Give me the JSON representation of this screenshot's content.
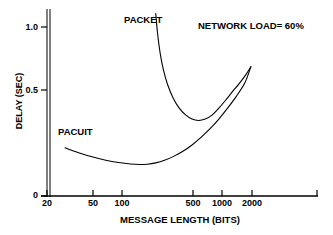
{
  "chart_data": {
    "type": "line",
    "title": "",
    "xlabel": "MESSAGE LENGTH (BITS)",
    "ylabel": "DELAY (SEC)",
    "xscale": "log",
    "xlim": [
      20,
      4000
    ],
    "ylim": [
      0,
      1.08
    ],
    "grid": false,
    "legend_position": "inline-labels",
    "xticks": [
      20,
      50,
      100,
      500,
      1000,
      2000
    ],
    "xtick_labels": [
      "20",
      "50",
      "100",
      "500",
      "1000",
      "2000"
    ],
    "yticks": [
      0,
      0.5,
      1.0
    ],
    "ytick_labels": [
      "0",
      "0.5",
      "1.0"
    ],
    "annotations": [
      {
        "name": "network-load",
        "text": "NETWORK LOAD= 60%"
      }
    ],
    "series": [
      {
        "name": "PACKET",
        "label": "PACKET",
        "color": "#000000",
        "points": [
          [
            230,
            1.08
          ],
          [
            240,
            0.96
          ],
          [
            255,
            0.84
          ],
          [
            275,
            0.74
          ],
          [
            300,
            0.66
          ],
          [
            340,
            0.58
          ],
          [
            390,
            0.52
          ],
          [
            450,
            0.48
          ],
          [
            520,
            0.455
          ],
          [
            600,
            0.447
          ],
          [
            700,
            0.455
          ],
          [
            820,
            0.48
          ],
          [
            950,
            0.52
          ],
          [
            1100,
            0.565
          ],
          [
            1300,
            0.62
          ],
          [
            1500,
            0.665
          ],
          [
            1750,
            0.72
          ],
          [
            1950,
            0.765
          ]
        ]
      },
      {
        "name": "PACUIT",
        "label": "PACUIT",
        "color": "#000000",
        "points": [
          [
            30,
            0.285
          ],
          [
            40,
            0.258
          ],
          [
            55,
            0.232
          ],
          [
            75,
            0.212
          ],
          [
            100,
            0.198
          ],
          [
            130,
            0.189
          ],
          [
            160,
            0.186
          ],
          [
            190,
            0.188
          ],
          [
            230,
            0.196
          ],
          [
            280,
            0.211
          ],
          [
            340,
            0.233
          ],
          [
            420,
            0.263
          ],
          [
            520,
            0.302
          ],
          [
            640,
            0.348
          ],
          [
            780,
            0.398
          ],
          [
            950,
            0.455
          ],
          [
            1150,
            0.518
          ],
          [
            1400,
            0.588
          ],
          [
            1700,
            0.668
          ],
          [
            1950,
            0.765
          ]
        ]
      }
    ]
  },
  "axes": {
    "y_title": "DELAY (SEC)",
    "x_title": "MESSAGE LENGTH (BITS)"
  },
  "annotation": {
    "network_load": "NETWORK LOAD= 60%"
  },
  "labels": {
    "packet": "PACKET",
    "pacuit": "PACUIT"
  },
  "ticks": {
    "x": [
      "20",
      "50",
      "100",
      "500",
      "1000",
      "2000"
    ],
    "y": [
      "1.0",
      "0.5",
      "0"
    ]
  },
  "colors": {
    "background": "#ffffff",
    "ink": "#000000",
    "curve": "#000000"
  }
}
